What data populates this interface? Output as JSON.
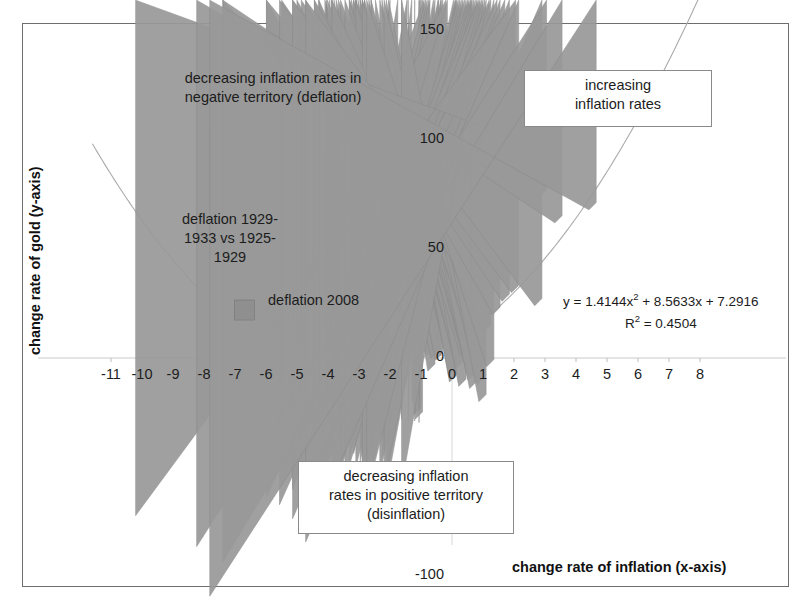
{
  "chart_data": {
    "type": "scatter",
    "title": "",
    "xlabel": "change rate of inflation (x-axis)",
    "ylabel": "change rate of gold (y-axis)",
    "xlim": [
      -11.8,
      8.6
    ],
    "ylim": [
      -100,
      150
    ],
    "xticks": [
      -11,
      -10,
      -9,
      -8,
      -7,
      -6,
      -5,
      -4,
      -3,
      -2,
      -1,
      0,
      1,
      2,
      3,
      4,
      5,
      6,
      7,
      8
    ],
    "yticks": [
      150,
      100,
      50,
      0,
      -100
    ],
    "grid": false,
    "legend": "none",
    "marker_color": "#999999",
    "trendline_color": "#aaaaaa",
    "trendline_equation": "y = 1.4144x",
    "trendline_equation_exp": "2",
    "trendline_equation_rest": " + 8.5633x + 7.2916",
    "r_squared_label": "R",
    "r_squared_exp": "2",
    "r_squared_value": " = 0.4504",
    "series": [
      {
        "name": "gold vs inflation change",
        "marker": "diamond",
        "points": [
          [
            -4.1,
            -33
          ],
          [
            -3.3,
            -37
          ],
          [
            -3.1,
            -38
          ],
          [
            -4.05,
            12
          ],
          [
            -3.1,
            13
          ],
          [
            -2.0,
            -2
          ],
          [
            -1.75,
            11
          ],
          [
            -1.45,
            12
          ],
          [
            -1.3,
            -3
          ],
          [
            -1.05,
            -20
          ],
          [
            -1.0,
            -23
          ],
          [
            -1.0,
            -26
          ],
          [
            -0.95,
            -28
          ],
          [
            -0.9,
            42
          ],
          [
            -0.85,
            20
          ],
          [
            -0.8,
            10
          ],
          [
            -0.75,
            2
          ],
          [
            -0.6,
            1
          ],
          [
            -0.55,
            -6
          ],
          [
            -0.45,
            0
          ],
          [
            -0.35,
            3
          ],
          [
            -0.3,
            -1
          ],
          [
            -0.2,
            62
          ],
          [
            -0.15,
            18
          ],
          [
            0.05,
            2
          ],
          [
            0.1,
            -3
          ],
          [
            0.12,
            -8
          ],
          [
            0.15,
            -11
          ],
          [
            0.2,
            14
          ],
          [
            0.25,
            4
          ],
          [
            0.3,
            -1
          ],
          [
            0.35,
            -5
          ],
          [
            0.4,
            9
          ],
          [
            0.45,
            -13
          ],
          [
            0.5,
            1
          ],
          [
            0.55,
            28
          ],
          [
            0.6,
            18
          ],
          [
            0.62,
            8
          ],
          [
            0.65,
            -2
          ],
          [
            0.7,
            -6
          ],
          [
            0.75,
            -10
          ],
          [
            0.8,
            -14
          ],
          [
            0.85,
            35
          ],
          [
            0.9,
            24
          ],
          [
            0.95,
            6
          ],
          [
            1.0,
            -2
          ],
          [
            1.05,
            -12
          ],
          [
            1.1,
            -20
          ],
          [
            1.2,
            30
          ],
          [
            1.25,
            12
          ],
          [
            1.35,
            -4
          ],
          [
            1.45,
            42
          ],
          [
            1.55,
            20
          ],
          [
            1.7,
            36
          ],
          [
            1.85,
            26
          ],
          [
            2.05,
            102
          ],
          [
            2.15,
            30
          ],
          [
            2.9,
            24
          ],
          [
            3.05,
            74
          ],
          [
            3.55,
            62
          ],
          [
            4.65,
            68
          ]
        ]
      },
      {
        "name": "deflation 2008",
        "marker": "square",
        "points": [
          [
            -6.7,
            22
          ]
        ]
      }
    ],
    "annotations": [
      {
        "id": "deflation-quadrant",
        "text": "decreasing inflation rates in\nnegative territory (deflation)",
        "boxed": false
      },
      {
        "id": "increasing-quadrant",
        "text": "increasing\ninflation rates",
        "boxed": true
      },
      {
        "id": "disinflation-quadrant",
        "text": "decreasing inflation\nrates in positive territory\n(disinflation)",
        "boxed": true
      },
      {
        "id": "deflation-1929",
        "text": "deflation 1929-\n1933 vs 1925-\n1929",
        "boxed": false
      },
      {
        "id": "deflation-2008",
        "text": "deflation 2008",
        "boxed": false
      }
    ]
  },
  "axis": {
    "x_title": "change rate of inflation (x-axis)",
    "y_title": "change rate of gold (y-axis)",
    "x_ticks": [
      "-11",
      "-10",
      "-9",
      "-8",
      "-7",
      "-6",
      "-5",
      "-4",
      "-3",
      "-2",
      "-1",
      "0",
      "1",
      "2",
      "3",
      "4",
      "5",
      "6",
      "7",
      "8"
    ],
    "y_ticks": [
      "150",
      "100",
      "50",
      "0",
      "-100"
    ]
  },
  "annotations": {
    "deflation_quadrant": "decreasing inflation rates in\nnegative territory (deflation)",
    "increasing_quadrant": "increasing\ninflation rates",
    "disinflation_quadrant": "decreasing inflation\nrates in positive territory\n(disinflation)",
    "deflation_1929": "deflation 1929-\n1933 vs 1925-\n1929",
    "deflation_2008": "deflation 2008"
  },
  "equation": {
    "line1_pre": "y = 1.4144x",
    "line1_exp": "2",
    "line1_post": " + 8.5633x + 7.2916",
    "line2_pre": "R",
    "line2_exp": "2",
    "line2_post": " = 0.4504"
  }
}
